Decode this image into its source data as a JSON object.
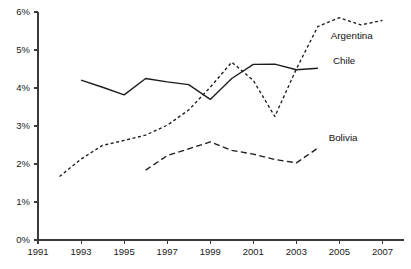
{
  "chart_data": {
    "type": "line",
    "title": "",
    "subtitle": "",
    "xlabel": "",
    "ylabel": "",
    "xlim": [
      1991,
      2008
    ],
    "ylim": [
      0,
      6
    ],
    "grid": false,
    "legend_position": "inline-right-of-series",
    "x_tick_labels": [
      "1991",
      "1993",
      "1995",
      "1997",
      "1999",
      "2001",
      "2003",
      "2005",
      "2007"
    ],
    "x_ticks": [
      1991,
      1993,
      1995,
      1997,
      1999,
      2001,
      2003,
      2005,
      2007
    ],
    "y_tick_labels": [
      "0%",
      "1%",
      "2%",
      "3%",
      "4%",
      "5%",
      "6%"
    ],
    "y_ticks": [
      0,
      1,
      2,
      3,
      4,
      5,
      6
    ],
    "y_unit": "%",
    "series": [
      {
        "name": "Argentina",
        "style": "dotted",
        "dash": "3,2.6",
        "label_x": 2004.6,
        "label_y": 5.28,
        "x": [
          1992,
          1993,
          1994,
          1995,
          1996,
          1997,
          1998,
          1999,
          2000,
          2001,
          2002,
          2003,
          2004,
          2005,
          2006,
          2007
        ],
        "values": [
          1.67,
          2.13,
          2.49,
          2.62,
          2.76,
          3.02,
          3.42,
          4.02,
          4.68,
          4.2,
          3.25,
          4.5,
          5.62,
          5.85,
          5.66,
          5.78
        ]
      },
      {
        "name": "Chile",
        "style": "solid",
        "dash": "",
        "label_x": 2004.7,
        "label_y": 4.62,
        "x": [
          1993,
          1994,
          1995,
          1996,
          1997,
          1998,
          1999,
          2000,
          2001,
          2002,
          2003,
          2004
        ],
        "values": [
          4.21,
          4.02,
          3.82,
          4.25,
          4.16,
          4.09,
          3.7,
          4.25,
          4.62,
          4.63,
          4.48,
          4.52
        ]
      },
      {
        "name": "Bolivia",
        "style": "dashed",
        "dash": "6,3.4",
        "label_x": 2004.5,
        "label_y": 2.6,
        "x": [
          1996,
          1997,
          1998,
          1999,
          2000,
          2001,
          2002,
          2003,
          2004
        ],
        "values": [
          1.84,
          2.22,
          2.4,
          2.58,
          2.36,
          2.26,
          2.12,
          2.03,
          2.42
        ]
      }
    ]
  },
  "caption": {
    "text": "",
    "visible": false
  }
}
